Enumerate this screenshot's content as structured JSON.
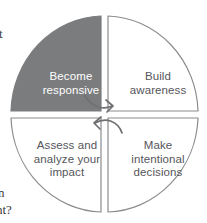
{
  "diagram": {
    "type": "cycle-quadrant-wheel",
    "quadrants": [
      {
        "id": "become-responsive",
        "label": "Become\nresponsive",
        "position": "top-left",
        "filled": true,
        "fill_color": "#7b7c7e",
        "text_color": "#ffffff"
      },
      {
        "id": "build-awareness",
        "label": "Build\nawareness",
        "position": "top-right",
        "filled": false,
        "fill_color": "#ffffff",
        "text_color": "#55565a"
      },
      {
        "id": "assess-and-analyze-your-impact",
        "label": "Assess and\nanalyze your\nimpact",
        "position": "bottom-left",
        "filled": false,
        "fill_color": "#ffffff",
        "text_color": "#55565a"
      },
      {
        "id": "make-intentional-decisions",
        "label": "Make\nintentional\ndecisions",
        "position": "bottom-right",
        "filled": false,
        "fill_color": "#ffffff",
        "text_color": "#55565a"
      }
    ],
    "arrows": [
      {
        "id": "arrow-top-right-down",
        "direction": "clockwise",
        "from": "become-responsive",
        "to": "make-intentional-decisions"
      },
      {
        "id": "arrow-bottom-left-up",
        "direction": "clockwise",
        "from": "make-intentional-decisions",
        "to": "assess-and-analyze-your-impact"
      }
    ],
    "stroke_color": "#8b8c8e"
  },
  "edge_text": {
    "fragment_top": "t",
    "fragment_bottom_1": "n",
    "fragment_bottom_2": "ht?"
  }
}
